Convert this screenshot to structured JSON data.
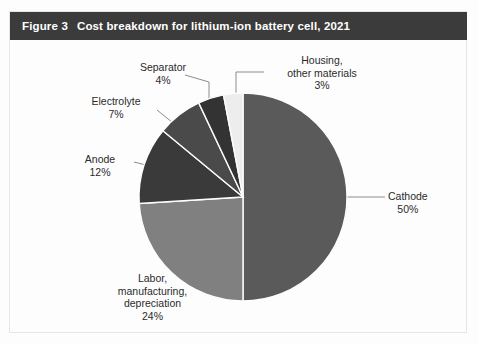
{
  "figure": {
    "number": "Figure 3",
    "title": "Cost breakdown for lithium-ion battery cell, 2021",
    "title_bar_color": "#3b3b3b",
    "title_text_color": "#ffffff",
    "background_color": "#fdfdfd",
    "border_color": "#e6e6e6"
  },
  "chart_data": {
    "type": "pie",
    "title": "Cost breakdown for lithium-ion battery cell, 2021",
    "xlabel": "",
    "ylabel": "",
    "units": "percent",
    "legend_position": "none",
    "labels_inline": true,
    "start_angle_deg": 0,
    "direction": "clockwise",
    "categories": [
      "Cathode",
      "Labor, manufacturing, depreciation",
      "Anode",
      "Electrolyte",
      "Separator",
      "Housing, other materials"
    ],
    "values": [
      50,
      24,
      12,
      7,
      4,
      3
    ],
    "colors": [
      "#5a5a5a",
      "#808080",
      "#3a3a3a",
      "#4a4a4a",
      "#333333",
      "#ededed"
    ],
    "slices": [
      {
        "name": "Cathode",
        "value": 50,
        "value_label": "50%",
        "color": "#5a5a5a",
        "label_lines": [
          "Cathode"
        ],
        "label_x": 400,
        "label_y": 193
      },
      {
        "name": "Labor, manufacturing, depreciation",
        "value": 24,
        "value_label": "24%",
        "color": "#808080",
        "label_lines": [
          "Labor,",
          "manufacturing,",
          "depreciation"
        ],
        "label_x": 142,
        "label_y": 272
      },
      {
        "name": "Anode",
        "value": 12,
        "value_label": "12%",
        "color": "#3a3a3a",
        "label_lines": [
          "Anode"
        ],
        "label_x": 105,
        "label_y": 156
      },
      {
        "name": "Electrolyte",
        "value": 7,
        "value_label": "7%",
        "color": "#4a4a4a",
        "label_lines": [
          "Electrolyte"
        ],
        "label_x": 126,
        "label_y": 98
      },
      {
        "name": "Separator",
        "value": 4,
        "value_label": "4%",
        "color": "#333333",
        "label_lines": [
          "Separator"
        ],
        "label_x": 163,
        "label_y": 64
      },
      {
        "name": "Housing, other materials",
        "value": 3,
        "value_label": "3%",
        "color": "#ededed",
        "label_lines": [
          "Housing,",
          "other materials"
        ],
        "label_x": 321,
        "label_y": 58
      }
    ]
  },
  "labels": {
    "cathode": {
      "line1": "Cathode",
      "pct": "50%"
    },
    "labor": {
      "line1": "Labor,",
      "line2": "manufacturing,",
      "line3": "depreciation",
      "pct": "24%"
    },
    "anode": {
      "line1": "Anode",
      "pct": "12%"
    },
    "electrolyte": {
      "line1": "Electrolyte",
      "pct": "7%"
    },
    "separator": {
      "line1": "Separator",
      "pct": "4%"
    },
    "housing": {
      "line1": "Housing,",
      "line2": "other materials",
      "pct": "3%"
    }
  }
}
